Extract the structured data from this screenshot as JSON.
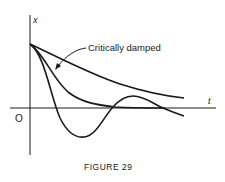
{
  "figure": {
    "caption": "FIGURE 29",
    "axes": {
      "y_label": "x",
      "x_label": "t",
      "origin_label": "O"
    },
    "annotation": "Critically damped",
    "curves": [
      {
        "name": "overdamped",
        "description": "slow monotone decay, stays above t-axis"
      },
      {
        "name": "critically-damped",
        "description": "fastest non-oscillatory decay to t-axis"
      },
      {
        "name": "underdamped",
        "description": "damped oscillation crossing t-axis"
      }
    ],
    "colors": {
      "ink": "#1a1a1a",
      "background": "#ffffff"
    }
  }
}
